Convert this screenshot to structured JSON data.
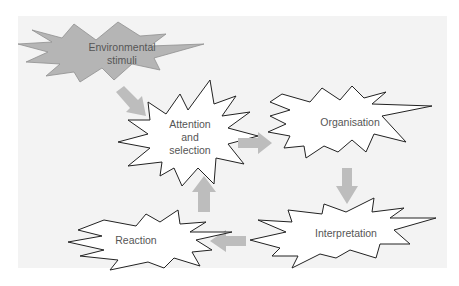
{
  "diagram": {
    "type": "flow",
    "colors": {
      "background": "#ffffff",
      "panel": "#f3f3f3",
      "stimuli_fill": "#b5b5b5",
      "burst_fill": "#ffffff",
      "burst_stroke": "#222222",
      "arrow": "#bdbdbd",
      "text": "#555555"
    },
    "nodes": [
      {
        "id": "stimuli",
        "label": "Environmental\nstimuli",
        "shape": "starburst-filled"
      },
      {
        "id": "attention",
        "label": "Attention\nand\nselection",
        "shape": "starburst"
      },
      {
        "id": "organisation",
        "label": "Organisation",
        "shape": "starburst"
      },
      {
        "id": "interpretation",
        "label": "Interpretation",
        "shape": "starburst"
      },
      {
        "id": "reaction",
        "label": "Reaction",
        "shape": "starburst"
      }
    ],
    "edges": [
      {
        "from": "stimuli",
        "to": "attention"
      },
      {
        "from": "attention",
        "to": "organisation"
      },
      {
        "from": "organisation",
        "to": "interpretation"
      },
      {
        "from": "interpretation",
        "to": "reaction"
      },
      {
        "from": "reaction",
        "to": "attention"
      }
    ]
  }
}
